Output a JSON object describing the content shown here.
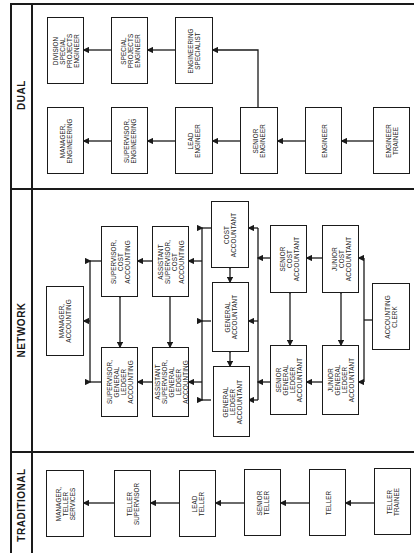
{
  "orientation": "rotated-90-ccw",
  "sections": {
    "dual": {
      "label": "DUAL"
    },
    "network": {
      "label": "NETWORK"
    },
    "traditional": {
      "label": "TRADITIONAL"
    }
  },
  "dual": {
    "boxes": [
      {
        "id": "division-special-projects-engineer",
        "label": "DIVISION\nSPECIAL\nPROJECTS\nENGINEER"
      },
      {
        "id": "special-projects-engineer",
        "label": "SPECIAL\nPROJECTS\nENGINEER"
      },
      {
        "id": "engineering-specialist",
        "label": "ENGINEERING\nSPECIALIST"
      },
      {
        "id": "manager-engineering",
        "label": "MANAGER,\nENGINEERING"
      },
      {
        "id": "supervisor-engineering",
        "label": "SUPERVISOR,\nENGINEERING"
      },
      {
        "id": "lead-engineer",
        "label": "LEAD\nENGINEER"
      },
      {
        "id": "senior-engineer",
        "label": "SENIOR\nENGINEER"
      },
      {
        "id": "engineer",
        "label": "ENGINEER"
      },
      {
        "id": "engineer-trainee",
        "label": "ENGINEER\nTRAINEE"
      }
    ]
  },
  "network": {
    "boxes": [
      {
        "id": "manager-accounting",
        "label": "MANAGER,\nACCOUNTING"
      },
      {
        "id": "supervisor-cost-accounting",
        "label": "SUPERVISOR,\nCOST\nACCOUNTING"
      },
      {
        "id": "assistant-supervisor-cost-accounting",
        "label": "ASSISTANT\nSUPERVISOR,\nCOST\nACCOUNTING"
      },
      {
        "id": "supervisor-general-ledger-accounting",
        "label": "SUPERVISOR,\nGENERAL\nLEDGER\nACCOUNTING"
      },
      {
        "id": "assistant-supervisor-general-ledger-accounting",
        "label": "ASSISTANT\nSUPERVISOR,\nGENERAL\nLEDGER\nACCOUNTING"
      },
      {
        "id": "cost-accountant",
        "label": "COST\nACCOUNTANT"
      },
      {
        "id": "general-accountant",
        "label": "GENERAL\nACCOUNTANT"
      },
      {
        "id": "general-ledger-accountant",
        "label": "GENERAL\nLEDGER\nACCOUNTANT"
      },
      {
        "id": "senior-cost-accountant",
        "label": "SENIOR\nCOST\nACCOUNTANT"
      },
      {
        "id": "senior-general-ledger-accountant",
        "label": "SENIOR\nGENERAL\nLEDGER\nACCOUNTANT"
      },
      {
        "id": "junior-cost-accountant",
        "label": "JUNIOR\nCOST\nACCOUNTANT"
      },
      {
        "id": "junior-general-ledger-accountant",
        "label": "JUNIOR\nGENERAL\nLEDGER\nACCOUNTANT"
      },
      {
        "id": "accounting-clerk",
        "label": "ACCOUNTING\nCLERK"
      }
    ]
  },
  "traditional": {
    "boxes": [
      {
        "id": "manager-teller-services",
        "label": "MANAGER,\nTELLER\nSERVICES"
      },
      {
        "id": "teller-supervisor",
        "label": "TELLER\nSUPERVISOR"
      },
      {
        "id": "lead-teller",
        "label": "LEAD\nTELLER"
      },
      {
        "id": "senior-teller",
        "label": "SENIOR\nTELLER"
      },
      {
        "id": "teller",
        "label": "TELLER"
      },
      {
        "id": "teller-trainee",
        "label": "TELLER\nTRAINEE"
      }
    ]
  },
  "colors": {
    "ink": "#1a1a1a",
    "paper": "#ffffff"
  }
}
